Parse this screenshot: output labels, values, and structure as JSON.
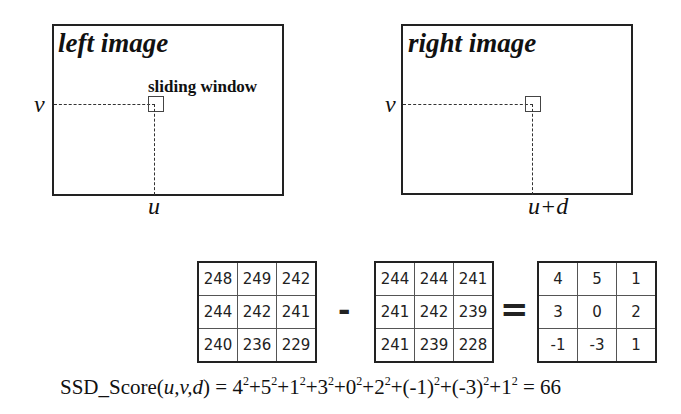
{
  "left_image": {
    "title": "left image",
    "row_label": "v",
    "col_label": "u",
    "window_label": "sliding window"
  },
  "right_image": {
    "title": "right image",
    "row_label": "v",
    "col_label": "u+d"
  },
  "operators": {
    "minus": "-",
    "equals": "="
  },
  "matrices": {
    "left_window": [
      [
        "248",
        "249",
        "242"
      ],
      [
        "244",
        "242",
        "241"
      ],
      [
        "240",
        "236",
        "229"
      ]
    ],
    "right_window": [
      [
        "244",
        "244",
        "241"
      ],
      [
        "241",
        "242",
        "239"
      ],
      [
        "241",
        "239",
        "228"
      ]
    ],
    "difference": [
      [
        "4",
        "5",
        "1"
      ],
      [
        "3",
        "0",
        "2"
      ],
      [
        "-1",
        "-3",
        "1"
      ]
    ]
  },
  "formula": {
    "lhs_name": "SSD_Score(",
    "lhs_args": "u,v,d",
    "lhs_close": ")",
    "terms": [
      "4",
      "5",
      "1",
      "3",
      "0",
      "2",
      "(-1)",
      "(-3)",
      "1"
    ],
    "exponent": "2",
    "equals": "=",
    "plus": "+",
    "result": "66"
  }
}
